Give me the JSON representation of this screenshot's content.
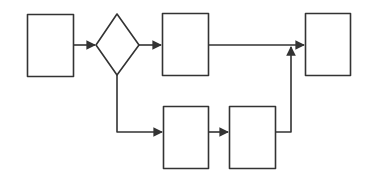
{
  "diagram": {
    "type": "flowchart",
    "stroke_color": "#333333",
    "background": "#ffffff",
    "nodes": [
      {
        "id": "box-start",
        "shape": "rect",
        "label": ""
      },
      {
        "id": "decision",
        "shape": "diamond",
        "label": ""
      },
      {
        "id": "box-upper-process",
        "shape": "rect",
        "label": ""
      },
      {
        "id": "box-end",
        "shape": "rect",
        "label": ""
      },
      {
        "id": "box-lower-process-1",
        "shape": "rect",
        "label": ""
      },
      {
        "id": "box-lower-process-2",
        "shape": "rect",
        "label": ""
      }
    ],
    "edges": [
      {
        "from": "box-start",
        "to": "decision"
      },
      {
        "from": "decision",
        "to": "box-upper-process"
      },
      {
        "from": "box-upper-process",
        "to": "box-end"
      },
      {
        "from": "decision",
        "to": "box-lower-process-1"
      },
      {
        "from": "box-lower-process-1",
        "to": "box-lower-process-2"
      },
      {
        "from": "box-lower-process-2",
        "to": "box-end"
      }
    ]
  }
}
